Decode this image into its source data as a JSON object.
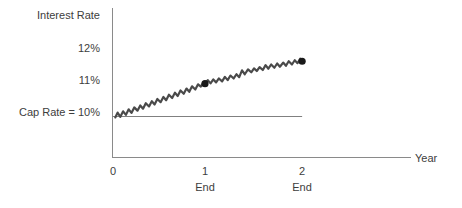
{
  "chart_data": {
    "type": "line",
    "title": "",
    "xlabel": "Year",
    "ylabel": "Interest Rate",
    "grid": false,
    "legend": "none",
    "xlim": [
      0,
      2.3
    ],
    "ylim": [
      9.0,
      12.6
    ],
    "y_tick_labels": [
      "12%",
      "11%"
    ],
    "y_tick_values": [
      12,
      11
    ],
    "x_tick_labels": [
      "0",
      "1",
      "2"
    ],
    "x_tick_values": [
      0,
      1,
      2
    ],
    "x_sub_tick_labels": [
      "",
      "End",
      "End"
    ],
    "reference_line": {
      "label": "Cap Rate = 10%",
      "value": 10,
      "x_start": 0,
      "x_end": 2.05,
      "color": "#808080"
    },
    "series": [
      {
        "name": "Interest Rate Path (Year 0 to End of Year 1)",
        "color": "#4a4a4a",
        "points": [
          [
            0.03,
            9.97
          ],
          [
            0.055,
            10.12
          ],
          [
            0.085,
            9.99
          ],
          [
            0.115,
            10.16
          ],
          [
            0.145,
            10.05
          ],
          [
            0.175,
            10.22
          ],
          [
            0.205,
            10.11
          ],
          [
            0.235,
            10.28
          ],
          [
            0.27,
            10.18
          ],
          [
            0.3,
            10.34
          ],
          [
            0.33,
            10.24
          ],
          [
            0.36,
            10.41
          ],
          [
            0.395,
            10.31
          ],
          [
            0.425,
            10.47
          ],
          [
            0.455,
            10.37
          ],
          [
            0.485,
            10.54
          ],
          [
            0.52,
            10.44
          ],
          [
            0.55,
            10.6
          ],
          [
            0.58,
            10.5
          ],
          [
            0.61,
            10.67
          ],
          [
            0.645,
            10.57
          ],
          [
            0.675,
            10.73
          ],
          [
            0.705,
            10.63
          ],
          [
            0.735,
            10.8
          ],
          [
            0.77,
            10.7
          ],
          [
            0.8,
            10.86
          ],
          [
            0.83,
            10.76
          ],
          [
            0.86,
            10.93
          ],
          [
            0.895,
            10.83
          ],
          [
            0.925,
            10.99
          ],
          [
            0.955,
            10.92
          ],
          [
            0.985,
            11.06
          ],
          [
            1.0,
            11.01
          ]
        ],
        "end_marker": {
          "x": 1.0,
          "y": 11.01,
          "label": ""
        }
      },
      {
        "name": "Interest Rate Path (End of Year 1 to End of Year 2)",
        "color": "#4a4a4a",
        "points": [
          [
            1.0,
            11.01
          ],
          [
            1.03,
            11.12
          ],
          [
            1.06,
            11.02
          ],
          [
            1.09,
            11.14
          ],
          [
            1.12,
            11.05
          ],
          [
            1.15,
            11.17
          ],
          [
            1.185,
            11.08
          ],
          [
            1.215,
            11.22
          ],
          [
            1.245,
            11.12
          ],
          [
            1.275,
            11.26
          ],
          [
            1.31,
            11.17
          ],
          [
            1.34,
            11.3
          ],
          [
            1.37,
            11.21
          ],
          [
            1.4,
            11.42
          ],
          [
            1.43,
            11.3
          ],
          [
            1.465,
            11.45
          ],
          [
            1.5,
            11.36
          ],
          [
            1.53,
            11.48
          ],
          [
            1.56,
            11.4
          ],
          [
            1.59,
            11.52
          ],
          [
            1.625,
            11.43
          ],
          [
            1.655,
            11.58
          ],
          [
            1.685,
            11.47
          ],
          [
            1.715,
            11.6
          ],
          [
            1.75,
            11.5
          ],
          [
            1.78,
            11.63
          ],
          [
            1.81,
            11.53
          ],
          [
            1.845,
            11.66
          ],
          [
            1.875,
            11.56
          ],
          [
            1.905,
            11.7
          ],
          [
            1.94,
            11.6
          ],
          [
            1.97,
            11.73
          ],
          [
            2.0,
            11.64
          ],
          [
            2.03,
            11.78
          ],
          [
            2.05,
            11.7
          ]
        ],
        "end_marker": {
          "x": 2.05,
          "y": 11.7,
          "label": ""
        }
      }
    ]
  }
}
